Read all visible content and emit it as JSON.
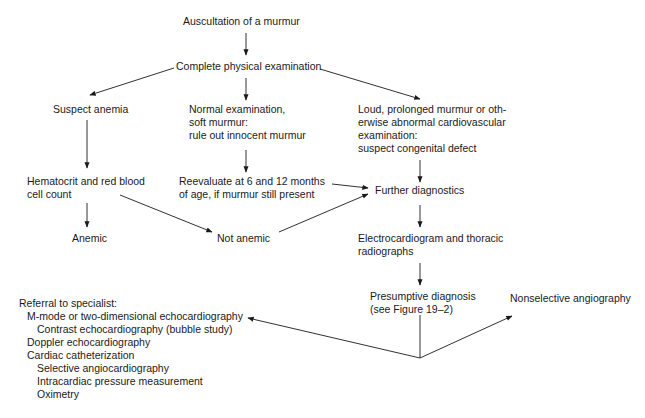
{
  "diagram": {
    "type": "flowchart",
    "nodes": {
      "auscultation": [
        "Auscultation of a murmur"
      ],
      "complete_exam": [
        "Complete physical examination"
      ],
      "suspect_anemia": [
        "Suspect anemia"
      ],
      "normal_exam": [
        "Normal examination,",
        "soft murmur:",
        "rule out innocent murmur"
      ],
      "loud_murmur": [
        "Loud, prolonged murmur or oth-",
        "erwise abnormal cardiovascular",
        "examination:",
        "suspect congenital defect"
      ],
      "hematocrit": [
        "Hematocrit and red blood",
        "cell count"
      ],
      "reevaluate": [
        "Reevaluate at 6 and 12 months",
        "of age, if murmur still present"
      ],
      "further_diagnostics": [
        "Further diagnostics"
      ],
      "anemic": [
        "Anemic"
      ],
      "not_anemic": [
        "Not anemic"
      ],
      "ecg": [
        "Electrocardiogram and thoracic",
        "radiographs"
      ],
      "presumptive": [
        "Presumptive diagnosis",
        "(see Figure 19–2)"
      ],
      "nonselective": [
        "Nonselective angiography"
      ],
      "referral": {
        "title": "Referral to specialist:",
        "items": [
          {
            "label": "M-mode or two-dimensional echocardiography",
            "level": 1
          },
          {
            "label": "Contrast echocardiography (bubble study)",
            "level": 2
          },
          {
            "label": "Doppler echocardiography",
            "level": 1
          },
          {
            "label": "Cardiac catheterization",
            "level": 1
          },
          {
            "label": "Selective angiocardiography",
            "level": 2
          },
          {
            "label": "Intracardiac pressure measurement",
            "level": 2
          },
          {
            "label": "Oximetry",
            "level": 2
          }
        ]
      }
    },
    "edges": [
      {
        "from": "auscultation",
        "to": "complete_exam"
      },
      {
        "from": "complete_exam",
        "to": "suspect_anemia"
      },
      {
        "from": "complete_exam",
        "to": "normal_exam"
      },
      {
        "from": "complete_exam",
        "to": "loud_murmur"
      },
      {
        "from": "suspect_anemia",
        "to": "hematocrit"
      },
      {
        "from": "normal_exam",
        "to": "reevaluate"
      },
      {
        "from": "loud_murmur",
        "to": "further_diagnostics"
      },
      {
        "from": "reevaluate",
        "to": "further_diagnostics"
      },
      {
        "from": "hematocrit",
        "to": "anemic"
      },
      {
        "from": "hematocrit",
        "to": "not_anemic"
      },
      {
        "from": "not_anemic",
        "to": "further_diagnostics"
      },
      {
        "from": "further_diagnostics",
        "to": "ecg"
      },
      {
        "from": "ecg",
        "to": "presumptive"
      },
      {
        "from": "presumptive",
        "to": "referral"
      },
      {
        "from": "presumptive",
        "to": "nonselective"
      }
    ]
  }
}
